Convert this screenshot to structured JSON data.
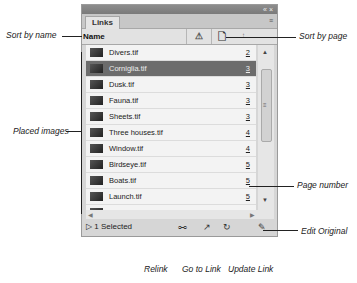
{
  "panel": {
    "tab_label": "Links",
    "window_controls": "« ×",
    "menu_icon": "≡",
    "header": {
      "name_label": "Name",
      "warn_icon": "⚠",
      "page_icon": "🗋",
      "sort_indicator": "↑"
    },
    "rows": [
      {
        "name": "Divers.tif",
        "page": "2",
        "selected": false
      },
      {
        "name": "Corniglia.tif",
        "page": "3",
        "selected": true
      },
      {
        "name": "Dusk.tif",
        "page": "3",
        "selected": false
      },
      {
        "name": "Fauna.tif",
        "page": "3",
        "selected": false
      },
      {
        "name": "Sheets.tif",
        "page": "3",
        "selected": false
      },
      {
        "name": "Three houses.tif",
        "page": "4",
        "selected": false
      },
      {
        "name": "Window.tif",
        "page": "4",
        "selected": false
      },
      {
        "name": "Birdseye.tif",
        "page": "5",
        "selected": false
      },
      {
        "name": "Boats.tif",
        "page": "5",
        "selected": false
      },
      {
        "name": "Launch.tif",
        "page": "5",
        "selected": false
      },
      {
        "name": "Manarola.tif",
        "page": "5",
        "selected": false
      }
    ],
    "footer": {
      "selected_label": "1 Selected",
      "disclosure": "▷",
      "relink_icon": "⧟",
      "goto_icon": "↗",
      "update_icon": "↻",
      "edit_icon": "✎"
    }
  },
  "callouts": {
    "sort_by_name": "Sort by name",
    "sort_by_page": "Sort by page",
    "placed_images": "Placed images",
    "page_number": "Page number",
    "edit_original": "Edit Original",
    "relink": "Relink",
    "go_to_link": "Go to Link",
    "update_link": "Update Link"
  }
}
